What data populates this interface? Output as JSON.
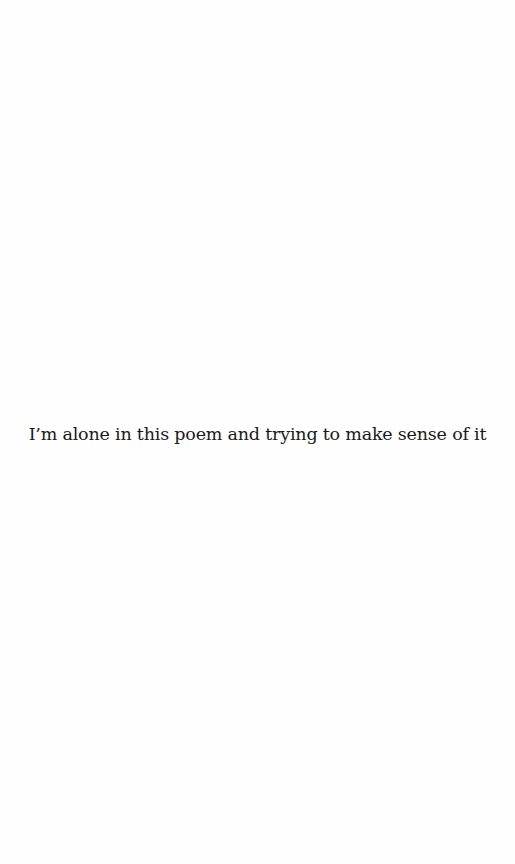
{
  "page": {
    "background": "#fefefe",
    "text_color": "#1a1a1a",
    "lines": [
      "I’m alone in this poem and trying to make sense of it"
    ]
  }
}
